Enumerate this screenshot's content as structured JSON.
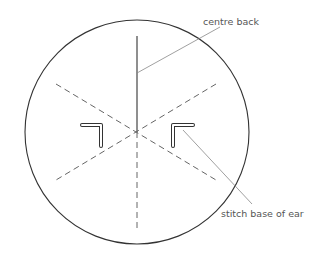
{
  "diagram": {
    "labels": {
      "centre_back": "centre back",
      "stitch_base_of_ear": "stitch base of ear"
    },
    "colors": {
      "outline": "#333333",
      "dashed": "#666666",
      "leader": "#888888",
      "text": "#555555"
    }
  }
}
